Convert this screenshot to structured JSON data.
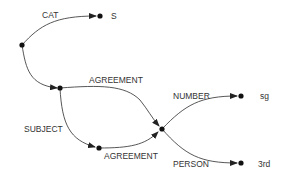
{
  "diagram": {
    "type": "feature-structure-graph",
    "nodes": [
      {
        "id": "root",
        "x": 22,
        "y": 45,
        "label": ""
      },
      {
        "id": "s",
        "x": 100,
        "y": 16,
        "label": "S"
      },
      {
        "id": "subj",
        "x": 60,
        "y": 88,
        "label": ""
      },
      {
        "id": "agr_lower",
        "x": 99,
        "y": 148,
        "label": ""
      },
      {
        "id": "agr",
        "x": 162,
        "y": 129,
        "label": ""
      },
      {
        "id": "sg",
        "x": 241,
        "y": 96,
        "label": "sg"
      },
      {
        "id": "third",
        "x": 241,
        "y": 163,
        "label": "3rd"
      }
    ],
    "edges": [
      {
        "from": "root",
        "to": "s",
        "label": "CAT"
      },
      {
        "from": "root",
        "to": "subj",
        "label": ""
      },
      {
        "from": "subj",
        "to": "agr",
        "label": "AGREEMENT"
      },
      {
        "from": "subj",
        "to": "agr_lower",
        "label": "SUBJECT"
      },
      {
        "from": "agr_lower",
        "to": "agr",
        "label": "AGREEMENT"
      },
      {
        "from": "agr",
        "to": "sg",
        "label": "NUMBER"
      },
      {
        "from": "agr",
        "to": "third",
        "label": "PERSON"
      }
    ],
    "labels": {
      "cat": "CAT",
      "s": "S",
      "agreement_top": "AGREEMENT",
      "subject": "SUBJECT",
      "agreement_bottom": "AGREEMENT",
      "number": "NUMBER",
      "sg": "sg",
      "person": "PERSON",
      "third": "3rd"
    }
  }
}
